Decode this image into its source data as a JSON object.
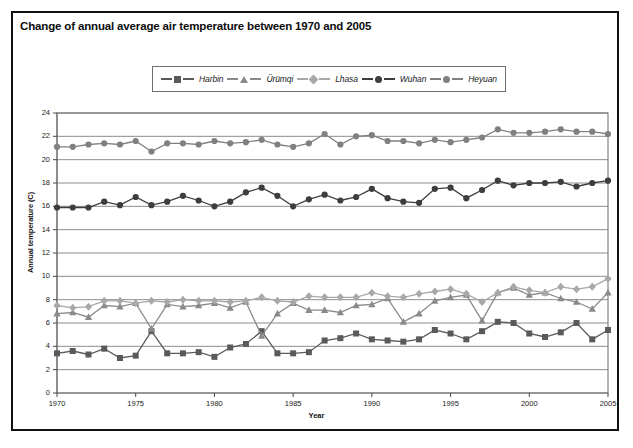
{
  "figure": {
    "title": "Change of annual average air temperature between 1970 and 2005"
  },
  "legend": {
    "items": [
      {
        "label": "Harbin",
        "marker": "square",
        "color": "#5a5a5a"
      },
      {
        "label": "Ürümqi",
        "marker": "triangle",
        "color": "#8a8a8a"
      },
      {
        "label": "Lhasa",
        "marker": "diamond",
        "color": "#a8a8a8"
      },
      {
        "label": "Wuhan",
        "marker": "circle",
        "color": "#3d3d3d"
      },
      {
        "label": "Heyuan",
        "marker": "circle",
        "color": "#808080"
      }
    ]
  },
  "axes": {
    "y_ticks": [
      "0",
      "2",
      "4",
      "6",
      "8",
      "10",
      "12",
      "14",
      "16",
      "18",
      "20",
      "22",
      "24"
    ],
    "x_ticks": [
      "1970",
      "1975",
      "1980",
      "1985",
      "1990",
      "1995",
      "2000",
      "2005"
    ]
  },
  "chart_data": {
    "type": "line",
    "title": "Change of annual average air temperature between 1970 and 2005",
    "xlabel": "Year",
    "ylabel": "Annual temperature (C)",
    "xlim": [
      1970,
      2005
    ],
    "ylim": [
      0,
      24
    ],
    "ytick_step": 2,
    "xtick_step": 5,
    "grid": true,
    "legend_position": "top-center",
    "x": [
      1970,
      1971,
      1972,
      1973,
      1974,
      1975,
      1976,
      1977,
      1978,
      1979,
      1980,
      1981,
      1982,
      1983,
      1984,
      1985,
      1986,
      1987,
      1988,
      1989,
      1990,
      1991,
      1992,
      1993,
      1994,
      1995,
      1996,
      1997,
      1998,
      1999,
      2000,
      2001,
      2002,
      2003,
      2004,
      2005
    ],
    "series": [
      {
        "name": "Harbin",
        "marker": "square",
        "color": "#5a5a5a",
        "values": [
          3.4,
          3.6,
          3.3,
          3.8,
          3.0,
          3.2,
          5.3,
          3.4,
          3.4,
          3.5,
          3.1,
          3.9,
          4.2,
          5.3,
          3.4,
          3.4,
          3.5,
          4.5,
          4.7,
          5.1,
          4.6,
          4.5,
          4.4,
          4.6,
          5.4,
          5.1,
          4.6,
          5.3,
          6.1,
          6.0,
          5.1,
          4.8,
          5.2,
          6.0,
          4.6,
          5.4
        ]
      },
      {
        "name": "Ürümqi",
        "marker": "triangle",
        "color": "#8a8a8a",
        "values": [
          6.8,
          6.9,
          6.5,
          7.5,
          7.4,
          7.7,
          5.5,
          7.6,
          7.4,
          7.5,
          7.7,
          7.3,
          7.8,
          4.9,
          6.8,
          7.7,
          7.1,
          7.1,
          6.9,
          7.5,
          7.6,
          8.1,
          6.1,
          6.8,
          7.9,
          8.2,
          8.4,
          6.2,
          8.6,
          9.0,
          8.4,
          8.6,
          8.1,
          7.8,
          7.2,
          8.6
        ]
      },
      {
        "name": "Lhasa",
        "marker": "diamond",
        "color": "#a8a8a8",
        "values": [
          7.5,
          7.3,
          7.4,
          7.9,
          7.9,
          7.7,
          7.9,
          7.8,
          8.0,
          7.9,
          7.9,
          7.8,
          7.9,
          8.2,
          7.9,
          7.8,
          8.3,
          8.2,
          8.2,
          8.2,
          8.6,
          8.3,
          8.2,
          8.5,
          8.7,
          8.9,
          8.5,
          7.8,
          8.6,
          9.1,
          8.8,
          8.6,
          9.1,
          8.9,
          9.1,
          9.8
        ]
      },
      {
        "name": "Wuhan",
        "marker": "circle",
        "color": "#3d3d3d",
        "values": [
          15.9,
          15.9,
          15.9,
          16.4,
          16.1,
          16.8,
          16.1,
          16.4,
          16.9,
          16.5,
          16.0,
          16.4,
          17.2,
          17.6,
          16.9,
          16.0,
          16.6,
          17.0,
          16.5,
          16.8,
          17.5,
          16.7,
          16.4,
          16.3,
          17.5,
          17.6,
          16.7,
          17.4,
          18.2,
          17.8,
          18.0,
          18.0,
          18.1,
          17.7,
          18.0,
          18.2
        ]
      },
      {
        "name": "Heyuan",
        "marker": "circle",
        "color": "#808080",
        "values": [
          21.1,
          21.1,
          21.3,
          21.4,
          21.3,
          21.6,
          20.7,
          21.4,
          21.4,
          21.3,
          21.6,
          21.4,
          21.5,
          21.7,
          21.3,
          21.1,
          21.4,
          22.2,
          21.3,
          22.0,
          22.1,
          21.6,
          21.6,
          21.4,
          21.7,
          21.5,
          21.7,
          21.9,
          22.6,
          22.3,
          22.3,
          22.4,
          22.6,
          22.4,
          22.4,
          22.2
        ]
      }
    ]
  }
}
